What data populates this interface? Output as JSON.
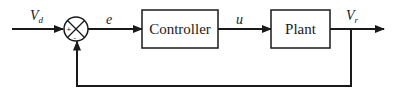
{
  "diagram": {
    "type": "feedback-control-block-diagram",
    "stroke_color": "#1a1a1a",
    "background": "#ffffff",
    "signals": {
      "input": {
        "main": "V",
        "sub": "d"
      },
      "error": "e",
      "control": "u",
      "output": {
        "main": "V",
        "sub": "r"
      }
    },
    "blocks": [
      {
        "id": "controller",
        "label": "Controller"
      },
      {
        "id": "plant",
        "label": "Plant"
      }
    ],
    "summing_junction": {
      "signs": [
        "+",
        "-"
      ]
    },
    "feedback": "unity"
  }
}
